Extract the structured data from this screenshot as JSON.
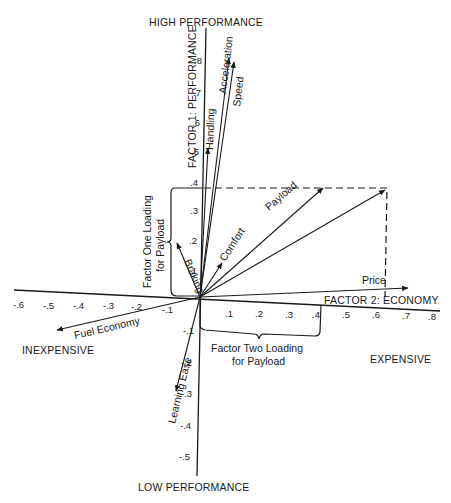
{
  "poles": {
    "top": "HIGH PERFORMANCE",
    "bottom": "LOW PERFORMANCE",
    "left": "INEXPENSIVE",
    "right": "EXPENSIVE"
  },
  "axes": {
    "factor1_label": "FACTOR 1: PERFORMANCE",
    "factor2_label": "FACTOR 2: ECONOMY",
    "x_ticks_neg": [
      "-.6",
      "-.5",
      "-.4",
      "-.3",
      "-.2",
      "-.1"
    ],
    "x_ticks_pos": [
      ".1",
      ".2",
      ".3",
      ".4",
      ".5",
      ".6",
      ".7",
      ".8"
    ],
    "y_ticks_pos": [
      ".1",
      ".2",
      ".3",
      ".4",
      ".5",
      ".6",
      ".7",
      ".8"
    ],
    "y_ticks_neg": [
      "-.1",
      "-.2",
      "-.3",
      "-.4",
      "-.5"
    ]
  },
  "vectors": [
    {
      "name": "Acceleration",
      "x": 0.08,
      "y": 0.85
    },
    {
      "name": "Speed",
      "x": 0.1,
      "y": 0.83
    },
    {
      "name": "Handling",
      "x": 0.02,
      "y": 0.5
    },
    {
      "name": "Payload",
      "x": 0.43,
      "y": 0.38
    },
    {
      "name": "Comfort",
      "x": 0.06,
      "y": 0.12
    },
    {
      "name": "Braking",
      "x": -0.05,
      "y": 0.17
    },
    {
      "name": "Price",
      "x": 0.7,
      "y": 0.05
    },
    {
      "name": "Fuel Economy",
      "x": -0.42,
      "y": -0.08
    },
    {
      "name": "Learning Ease",
      "x": -0.09,
      "y": -0.25
    }
  ],
  "annotations": {
    "factor_one_loading_line1": "Factor One Loading",
    "factor_one_loading_line2": "for Payload",
    "factor_two_loading_line1": "Factor Two Loading",
    "factor_two_loading_line2": "for Payload"
  }
}
